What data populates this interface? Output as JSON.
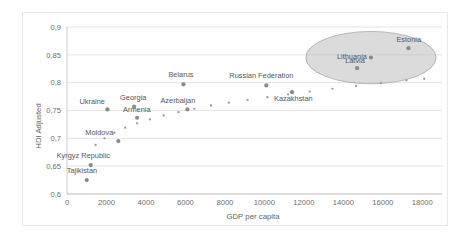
{
  "chart_data": {
    "type": "scatter",
    "title": "",
    "xlabel": "GDP per capita",
    "ylabel": "HDI Adjusted",
    "xlim": [
      0,
      19000
    ],
    "ylim": [
      0.6,
      0.9
    ],
    "xticks": [
      "0",
      "2000",
      "4000",
      "6000",
      "8000",
      "10000",
      "12000",
      "14000",
      "16000",
      "18000"
    ],
    "xtick_values": [
      0,
      2000,
      4000,
      6000,
      8000,
      10000,
      12000,
      14000,
      16000,
      18000
    ],
    "yticks": [
      "0,6",
      "0,65",
      "0,7",
      "0,75",
      "0,8",
      "0,85",
      "0,9"
    ],
    "ytick_values": [
      0.6,
      0.65,
      0.7,
      0.75,
      0.8,
      0.85,
      0.9
    ],
    "grid": "horizontal",
    "legend": "none",
    "points": [
      {
        "label": "Tajikistan",
        "x": 1000,
        "y": 0.625,
        "label_dx": -20,
        "label_dy": -7
      },
      {
        "label": "Kyrgyz Republic",
        "x": 1200,
        "y": 0.652,
        "label_dx": -34,
        "label_dy": -7
      },
      {
        "label": "Moldova",
        "x": 2600,
        "y": 0.695,
        "label_dx": -33,
        "label_dy": -6
      },
      {
        "label": "Ukraine",
        "x": 2050,
        "y": 0.752,
        "label_dx": -28,
        "label_dy": -5
      },
      {
        "label": "Georgia",
        "x": 3400,
        "y": 0.757,
        "label_dx": -14,
        "label_dy": -7
      },
      {
        "label": "Armenia",
        "x": 3550,
        "y": 0.737,
        "label_dx": -14,
        "label_dy": -6
      },
      {
        "label": "Azerbaijan",
        "x": 6100,
        "y": 0.752,
        "label_dx": -27,
        "label_dy": -6
      },
      {
        "label": "Belarus",
        "x": 5900,
        "y": 0.797,
        "label_dx": -15,
        "label_dy": -7
      },
      {
        "label": "Russian Federation",
        "x": 10100,
        "y": 0.795,
        "label_dx": -37,
        "label_dy": -7
      },
      {
        "label": "Kazakhstan",
        "x": 11400,
        "y": 0.783,
        "label_dx": -18,
        "label_dy": 9
      },
      {
        "label": "Latvia",
        "x": 14700,
        "y": 0.826,
        "label_dx": -12,
        "label_dy": -5
      },
      {
        "label": "Lithuania",
        "x": 15400,
        "y": 0.845,
        "label_dx": -34,
        "label_dy": 1
      },
      {
        "label": "Estonia",
        "x": 17300,
        "y": 0.862,
        "label_dx": -12,
        "label_dy": -6
      }
    ],
    "trendline": {
      "style": "dotted",
      "description": "logarithmic fit through the data",
      "points_x": [
        1450,
        1900,
        2400,
        2950,
        3550,
        4200,
        4900,
        5650,
        6450,
        7300,
        8200,
        9150,
        10150,
        11200,
        12300,
        13450,
        14650,
        15900,
        17200,
        18100
      ],
      "points_y": [
        0.688,
        0.7,
        0.71,
        0.719,
        0.727,
        0.734,
        0.741,
        0.747,
        0.753,
        0.759,
        0.764,
        0.769,
        0.774,
        0.779,
        0.784,
        0.789,
        0.794,
        0.799,
        0.804,
        0.807
      ]
    },
    "highlight": {
      "name": "baltic-states-highlight",
      "shape": "ellipse",
      "center_x": 15400,
      "center_y": 0.845,
      "radius_x": 3300,
      "radius_y": 0.047,
      "members": [
        "Latvia",
        "Lithuania",
        "Estonia"
      ]
    }
  }
}
